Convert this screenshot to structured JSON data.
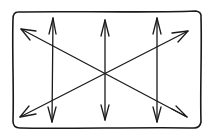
{
  "diagram": {
    "title": "",
    "style": "hand-drawn sketch",
    "frame": {
      "shape": "rounded-rectangle"
    },
    "arrows": [
      {
        "name": "vertical-left",
        "direction": "bidirectional",
        "orientation": "vertical"
      },
      {
        "name": "vertical-center",
        "direction": "bidirectional",
        "orientation": "vertical"
      },
      {
        "name": "vertical-right",
        "direction": "bidirectional",
        "orientation": "vertical"
      },
      {
        "name": "diagonal-down",
        "direction": "bidirectional",
        "orientation": "top-left to bottom-right"
      },
      {
        "name": "diagonal-up",
        "direction": "bidirectional",
        "orientation": "bottom-left to top-right"
      }
    ],
    "colors": {
      "ink": "#1a1a1a",
      "background": "#ffffff"
    }
  }
}
